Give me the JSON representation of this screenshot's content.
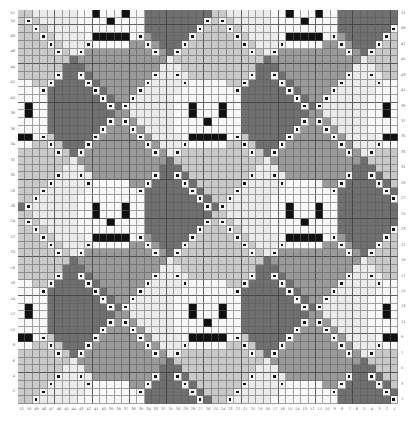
{
  "chart_data": {
    "type": "heatmap",
    "title": "",
    "xlabel": "",
    "ylabel": "",
    "grid": true,
    "legend_position": "none",
    "columns": 51,
    "rows": 51,
    "x_tick_labels_right_to_left": [
      1,
      2,
      3,
      4,
      5,
      6,
      7,
      8,
      9,
      10,
      11,
      12,
      13,
      14,
      15,
      16,
      17,
      18,
      19,
      20,
      21,
      22,
      23,
      24,
      25,
      26,
      27,
      28,
      29,
      30,
      31,
      32,
      33,
      34,
      35,
      36,
      37,
      38,
      39,
      40,
      41,
      42,
      43,
      44,
      45,
      46,
      47,
      48,
      49,
      50,
      51
    ],
    "y_tick_labels_bottom_to_top": [
      1,
      2,
      3,
      4,
      5,
      6,
      7,
      8,
      9,
      10,
      11,
      12,
      13,
      14,
      15,
      16,
      17,
      18,
      19,
      20,
      21,
      22,
      23,
      24,
      25,
      26,
      27,
      28,
      29,
      30,
      31,
      32,
      33,
      34,
      35,
      36,
      37,
      38,
      39,
      40,
      41,
      42,
      43,
      44,
      45,
      46,
      47,
      48,
      49,
      50,
      51
    ],
    "y_labels_left_shown": [
      51,
      50,
      48,
      46,
      44,
      42,
      40,
      38,
      36,
      34,
      32,
      30,
      28,
      26,
      24,
      22,
      20,
      18,
      16,
      14,
      12,
      10,
      8,
      6,
      4,
      2
    ],
    "y_labels_right_shown": [
      51,
      49,
      47,
      45,
      43,
      41,
      39,
      37,
      35,
      33,
      31,
      29,
      27,
      25,
      23,
      21,
      19,
      17,
      15,
      13,
      11,
      9,
      7,
      5,
      3,
      1
    ],
    "palette": {
      "lightest": "#ebebeb",
      "light_mid": "#c9c9c9",
      "mid": "#9a9a9a",
      "dark": "#707070",
      "motif_white": "#f8f8f8",
      "motif_black": "#111111",
      "symbol_dot": "#151515",
      "gridline": "#5a5a5a",
      "label_text": "#6f6f6f",
      "background": "#ffffff"
    },
    "symbols": {
      "plain": "solid colour block",
      "dot": "light square with small dark centre dot",
      "black": "solid black square",
      "white": "solid white square"
    },
    "motifs": {
      "background": "argyle diamond lattice in four grey values",
      "accent": "skull faces with two eyes, nose and mouth",
      "lattice": "diagonal chains of dotted symbol stitches"
    }
  }
}
